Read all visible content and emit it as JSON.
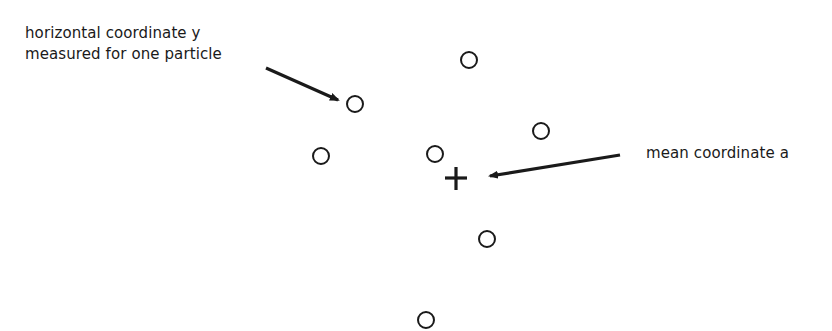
{
  "diagram": {
    "annotations": {
      "particle_label_line1": "horizontal coordinate y",
      "particle_label_line2": "measured for one particle",
      "mean_label": "mean coordinate a"
    },
    "particle_count": 8,
    "mean_marker": "plus",
    "colors": {
      "ink": "#1a1a1a",
      "background": "#ffffff"
    }
  }
}
